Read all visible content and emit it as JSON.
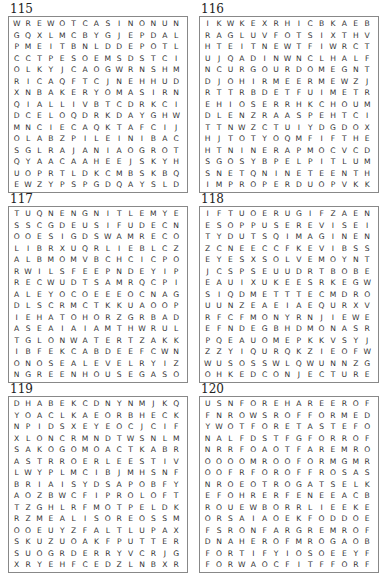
{
  "puzzles": [
    {
      "number": "115",
      "rows": [
        "WREWOTCASINONUN",
        "GQXLMCBYGJEPDAL",
        "PMEITBNLDDEPOTL",
        "CCTPESOEMSDSTCI",
        "OLKYJCAOGWRNSHM",
        "RICAQFTCJNEHHUD",
        "XNBAKERYOMASIRN",
        "QIALLIVBTCDRKCI",
        "DCELOQDRKDAYGHW",
        "MNCIECAQKTAFCIJ",
        "OLABZPILEINIBAC",
        "SGLRAJANIAOGROT",
        "QYAACAAHEEJSKYH",
        "UOPRTLDKCMBSKBQ",
        "EWZYPSPGDQAYSLD"
      ]
    },
    {
      "number": "116",
      "rows": [
        "IKWKEXRHICBKAEB",
        "RAGLUVFOTSIXTHV",
        "HTEITNEWTFIWRCT",
        "UJQADINWNCLHALF",
        "NCURGOURDOMEGNT",
        "DJOHIRMEERMEWZJ",
        "RTTRBDETFUIMETR",
        "EHIOSERRHKCHOUM",
        "DLENZRAASPEHTCI",
        "TTNWZCTUIYDGDOX",
        "HJTOTYOQMFIFTHE",
        "HTNINERAPMOCVCD",
        "SGOSYBPELPITLUM",
        "SNETQNINETEENTH",
        "IMPROPERDUOPVKK"
      ]
    },
    {
      "number": "117",
      "rows": [
        "TUQNENGNITLEMYE",
        "SSCGDEUSIFUDECN",
        "OOESIGDSWAMRECO",
        "LIBRXUQRLIEBLCZ",
        "ALBMOMVBCHCICPO",
        "RWILSFEEPNDEYIP",
        "RECWUDTSAMRQCPI",
        "ALEYOCOEEEOCNAG",
        "DLSCRMCTKKUAOOP",
        "IEHATOHORZGRBAD",
        "ASEAIAIAMTHWRUL",
        "TGLONWATERTZAKK",
        "IBFEKCABDEEFCWN",
        "ONOSEALEVELRYIZ",
        "NGREENHOUSEGASO"
      ]
    },
    {
      "number": "118",
      "rows": [
        "IFTUOERUGIFZAEN",
        "ESOPPUSEREVISEI",
        "TYDUTSQIMAGINEN",
        "ZCNEECCFKEVIBSS",
        "EYESXSOLVEMOYNT",
        "JCSPSEUUDRTBOBE",
        "EAUIXUKEESRKEGW",
        "SIQDMETTTECMDRO",
        "UUNZEAEIAEQURXV",
        "RFCFMONYRNJIEWE",
        "EFNDEGBHDMONASR",
        "PQEAUOMEPKKVSYJ",
        "ZZYIQURQKZIEOFW",
        "WUSOSSWLQWUNNZG",
        "OHKEDCONJECTURE"
      ]
    },
    {
      "number": "119",
      "rows": [
        "DHABEKCDNYNMJKQ",
        "YOACLKAEORBHECK",
        "NPIDSXEYEOCJCIF",
        "XLONCRMNDTWSNLM",
        "SAKOGOMOACTKABR",
        "ASTRROERLEESTIV",
        "LWYPLMCIBJMHSNF",
        "BRIAISYDSAPOBFY",
        "AOZBWCFIPROLOFT",
        "TZGHLRFMOTPELDK",
        "RZMEALISOREOSSM",
        "OOEUYZFALTLUPAX",
        "SKUZUOAKFPUTTER",
        "SUOGRDERRYVCRJG",
        "XRYEHFCEDZLNBXR"
      ]
    },
    {
      "number": "120",
      "rows": [
        "USNFOREHAREEROF",
        "FNROWSROFFORMED",
        "YWOTFORETASTEFO",
        "NALFDSTFGFORROF",
        "NRRFOAOTFAREMRO",
        "OOOOMROOFORMGMR",
        "OOFRFOROFFROSAS",
        "NROEOTROGATSELK",
        "EFOHRERFENEEACB",
        "ROUEWBORRLIEEKE",
        "ORSAIAOEKFODDOE",
        "FSRONFARGREMROF",
        "DNAHEROFMROGAOB",
        "FORTIFYIOSOEEYF",
        "FORWAOCFITFFORF"
      ]
    }
  ]
}
